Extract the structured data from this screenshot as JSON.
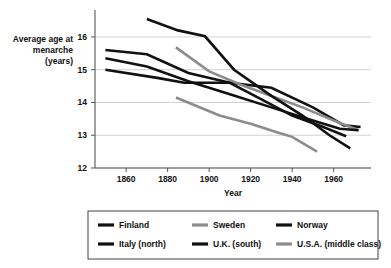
{
  "chart_data": {
    "type": "line",
    "title": "",
    "xlabel": "Year",
    "ylabel": "Average age at menarche (years)",
    "ylabel_lines": [
      "Average age at",
      "menarche",
      "(years)"
    ],
    "xlim": [
      1845,
      1978
    ],
    "ylim": [
      12,
      16.7
    ],
    "xticks": [
      1860,
      1880,
      1900,
      1920,
      1940,
      1960
    ],
    "yticks": [
      12,
      13,
      14,
      15,
      16
    ],
    "grid": "horizontal",
    "legend_position": "below-plot",
    "series": [
      {
        "name": "Finland",
        "color": "#111111",
        "width": 2.6,
        "x": [
          1850,
          1870,
          1890,
          1910,
          1930,
          1950,
          1965,
          1973
        ],
        "y": [
          15.6,
          15.47,
          14.9,
          14.6,
          14.45,
          13.85,
          13.3,
          13.25
        ]
      },
      {
        "name": "Sweden",
        "color": "#8c8c8c",
        "width": 2.6,
        "x": [
          1884,
          1900,
          1915,
          1930,
          1945,
          1960,
          1972
        ],
        "y": [
          15.68,
          14.95,
          14.55,
          14.2,
          13.85,
          13.45,
          13.15
        ]
      },
      {
        "name": "Norway",
        "color": "#111111",
        "width": 2.6,
        "x": [
          1850,
          1870,
          1890,
          1910,
          1930,
          1950,
          1963,
          1972
        ],
        "y": [
          15.35,
          15.1,
          14.65,
          14.25,
          13.85,
          13.45,
          13.2,
          13.15
        ]
      },
      {
        "name": "Italy (north)",
        "color": "#111111",
        "width": 2.6,
        "x": [
          1870,
          1885,
          1898,
          1912,
          1930,
          1945,
          1958,
          1968
        ],
        "y": [
          16.55,
          16.2,
          16.02,
          15.0,
          14.2,
          13.6,
          13.0,
          12.6
        ]
      },
      {
        "name": "U.K. (south)",
        "color": "#111111",
        "width": 2.6,
        "x": [
          1850,
          1875,
          1888,
          1910,
          1925,
          1940,
          1955,
          1966
        ],
        "y": [
          15.0,
          14.75,
          14.6,
          14.6,
          14.1,
          13.6,
          13.25,
          12.97
        ]
      },
      {
        "name": "U.S.A. (middle class)",
        "color": "#8c8c8c",
        "width": 2.6,
        "x": [
          1884,
          1905,
          1920,
          1933,
          1940,
          1952
        ],
        "y": [
          14.15,
          13.6,
          13.35,
          13.08,
          12.95,
          12.5
        ]
      }
    ]
  },
  "legend": {
    "items": [
      {
        "label": "Finland"
      },
      {
        "label": "Sweden"
      },
      {
        "label": "Norway"
      },
      {
        "label": "Italy (north)"
      },
      {
        "label": "U.K. (south)"
      },
      {
        "label": "U.S.A. (middle class)"
      }
    ]
  }
}
